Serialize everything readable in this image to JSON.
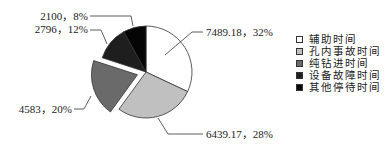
{
  "chart_data": {
    "type": "pie",
    "title": "",
    "categories": [
      "辅助时间",
      "孔内事故时间",
      "纯钻进时间",
      "设备故障时间",
      "其他停待时间"
    ],
    "values": [
      7489.18,
      6439.17,
      4583,
      2796,
      2100
    ],
    "percentages": [
      32,
      28,
      20,
      12,
      8
    ],
    "colors": [
      "#ffffff",
      "#c0c0c0",
      "#6a6a6a",
      "#1e1e1e",
      "#050505"
    ],
    "exploded": [
      false,
      false,
      true,
      false,
      false
    ],
    "data_labels": [
      "7489.18，32%",
      "6439.17，28%",
      "4583，20%",
      "2796，12%",
      "2100，8%"
    ],
    "legend_position": "right",
    "start_angle": "12 o'clock, clockwise"
  },
  "legend": {
    "items": [
      {
        "label": "辅助时间",
        "color": "#ffffff"
      },
      {
        "label": "孔内事故时间",
        "color": "#c0c0c0"
      },
      {
        "label": "纯钻进时间",
        "color": "#6a6a6a"
      },
      {
        "label": "设备故障时间",
        "color": "#1e1e1e"
      },
      {
        "label": "其他停待时间",
        "color": "#050505"
      }
    ]
  }
}
